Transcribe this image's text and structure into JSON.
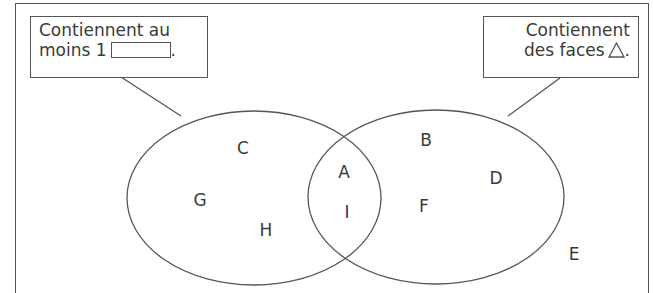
{
  "callouts": {
    "left": {
      "line1": "Contiennent au",
      "line2_prefix": "moins 1",
      "line2_suffix": ".",
      "shape_icon": "rectangle-icon"
    },
    "right": {
      "line1": "Contiennent",
      "line2_prefix": "des faces",
      "line2_suffix": ".",
      "shape_icon": "triangle-icon"
    }
  },
  "sets": {
    "left_only": [
      "C",
      "G",
      "H"
    ],
    "intersection": [
      "A",
      "I"
    ],
    "right_only": [
      "B",
      "D",
      "F"
    ],
    "outside": [
      "E"
    ]
  },
  "labels": {
    "C": "C",
    "G": "G",
    "H": "H",
    "A": "A",
    "I": "I",
    "B": "B",
    "D": "D",
    "F": "F",
    "E": "E"
  },
  "colors": {
    "stroke": "#555555",
    "text": "#3a3a3a",
    "background": "#ffffff"
  }
}
